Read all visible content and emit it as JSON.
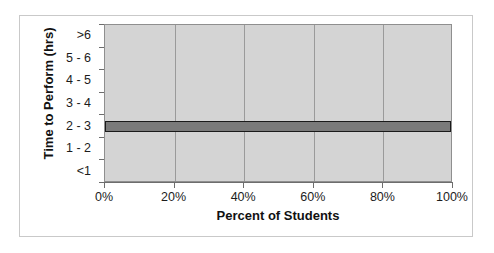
{
  "chart_data": {
    "type": "bar",
    "orientation": "horizontal",
    "title": "",
    "xlabel": "Percent of Students",
    "ylabel": "Time to Perform (hrs)",
    "categories": [
      ">6",
      "5 - 6",
      "4 - 5",
      "3 - 4",
      "2 - 3",
      "1 - 2",
      "<1"
    ],
    "values": [
      0,
      0,
      0,
      0,
      100,
      0,
      0
    ],
    "xlim": [
      0,
      100
    ],
    "xticks": [
      0,
      20,
      40,
      60,
      80,
      100
    ],
    "xticklabels": [
      "0%",
      "20%",
      "40%",
      "60%",
      "80%",
      "100%"
    ],
    "grid": "vertical",
    "legend": "none",
    "units": "percent",
    "series": [
      {
        "name": "Percent of Students",
        "values": [
          0,
          0,
          0,
          0,
          100,
          0,
          0
        ]
      }
    ]
  },
  "style": {
    "plot_background": "#d4d4d4",
    "bar_fill": "#7a7a7a",
    "bar_border": "#1a1a1a",
    "gridline_color": "#9a9a9a",
    "axis_color": "#6d6d6d",
    "frame_color": "#c9c9c9",
    "text_color": "#1c1c1c",
    "page_background": "#ffffff"
  }
}
